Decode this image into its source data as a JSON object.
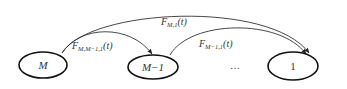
{
  "diagram": {
    "nodes": [
      {
        "id": "M",
        "label": "M",
        "cx": 43,
        "cy": 65,
        "rx": 24,
        "ry": 13,
        "italic": true
      },
      {
        "id": "M-1",
        "label": "M−1",
        "cx": 153,
        "cy": 67,
        "rx": 25,
        "ry": 12,
        "italic": true
      },
      {
        "id": "1",
        "label": "1",
        "cx": 293,
        "cy": 66,
        "rx": 25,
        "ry": 14,
        "italic": false
      }
    ],
    "ellipsis": "…",
    "edges": [
      {
        "from": "M",
        "to": "1",
        "label_main": "F",
        "label_sub": "M,1",
        "label_arg": "(t)"
      },
      {
        "from": "M",
        "to": "M-1",
        "label_main": "F",
        "label_sub": "M,M−1,1",
        "label_arg": "(t)"
      },
      {
        "from": "M-1",
        "to": "1",
        "label_main": "F",
        "label_sub": "M−1,1",
        "label_arg": "(t)"
      }
    ],
    "colors": {
      "stroke": "#111111",
      "edge": "#333333",
      "background": "#ffffff"
    }
  }
}
